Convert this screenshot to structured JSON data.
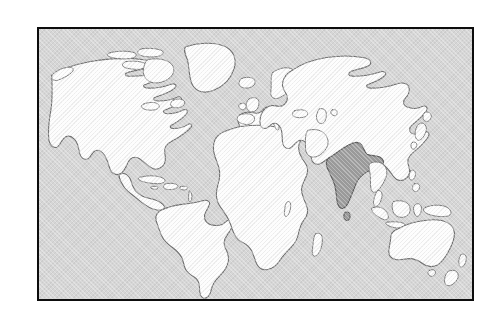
{
  "figure": {
    "type": "world-map",
    "kind": "choropleth-locator",
    "projection": "equirectangular",
    "frame": {
      "border_color": "#0d0d0d",
      "border_width_px": 2,
      "x": 37,
      "y": 27,
      "width": 437,
      "height": 274
    },
    "page_background": "#ffffff"
  },
  "colors": {
    "ocean": "#d6d6d6",
    "land_fill": "#fdfdfd",
    "land_outline": "#6e6e6e",
    "highlight_fill": "#9a9a9a",
    "highlight_outline": "#5a5a5a",
    "frame": "#0d0d0d"
  },
  "legend": {
    "visible": false,
    "entries": []
  },
  "labels": {
    "title": "",
    "caption": "",
    "visible_text": []
  },
  "highlighted_regions": [
    {
      "name": "India",
      "fill": "#9a9a9a",
      "continent": "Asia"
    }
  ],
  "landmasses": [
    {
      "name": "North America",
      "highlighted": false
    },
    {
      "name": "Greenland",
      "highlighted": false
    },
    {
      "name": "Central America",
      "highlighted": false
    },
    {
      "name": "Caribbean Islands",
      "highlighted": false
    },
    {
      "name": "South America",
      "highlighted": false
    },
    {
      "name": "Africa",
      "highlighted": false
    },
    {
      "name": "Madagascar",
      "highlighted": false
    },
    {
      "name": "Europe",
      "highlighted": false
    },
    {
      "name": "Iceland",
      "highlighted": false
    },
    {
      "name": "British Isles",
      "highlighted": false
    },
    {
      "name": "Scandinavia",
      "highlighted": false
    },
    {
      "name": "Asia",
      "highlighted": false
    },
    {
      "name": "India",
      "highlighted": true
    },
    {
      "name": "Sri Lanka",
      "highlighted": true
    },
    {
      "name": "Japan",
      "highlighted": false
    },
    {
      "name": "Philippines",
      "highlighted": false
    },
    {
      "name": "Indonesia",
      "highlighted": false
    },
    {
      "name": "New Guinea",
      "highlighted": false
    },
    {
      "name": "Australia",
      "highlighted": false
    },
    {
      "name": "New Zealand",
      "highlighted": false
    },
    {
      "name": "Tasmania",
      "highlighted": false
    }
  ]
}
